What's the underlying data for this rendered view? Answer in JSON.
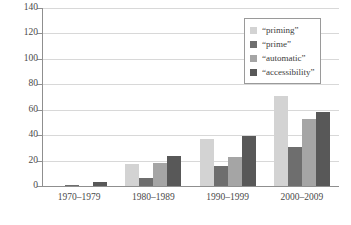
{
  "chart_data": {
    "type": "bar",
    "title": "",
    "xlabel": "",
    "ylabel": "",
    "ylim": [
      0,
      140
    ],
    "yticks": [
      0,
      20,
      40,
      60,
      80,
      100,
      120,
      140
    ],
    "grid": true,
    "legend_position": "top-right",
    "categories": [
      "1970–1979",
      "1980–1989",
      "1990–1999",
      "2000–2009"
    ],
    "series": [
      {
        "name": "“priming”",
        "color": "#d3d3d3",
        "values": [
          0,
          17,
          37,
          71
        ]
      },
      {
        "name": "“prime”",
        "color": "#6e6e6e",
        "values": [
          1,
          6,
          16,
          31
        ]
      },
      {
        "name": "“automatic”",
        "color": "#a5a5a5",
        "values": [
          0,
          18,
          23,
          53
        ]
      },
      {
        "name": "“accessibility”",
        "color": "#585858",
        "values": [
          3,
          24,
          39,
          58
        ]
      }
    ]
  }
}
